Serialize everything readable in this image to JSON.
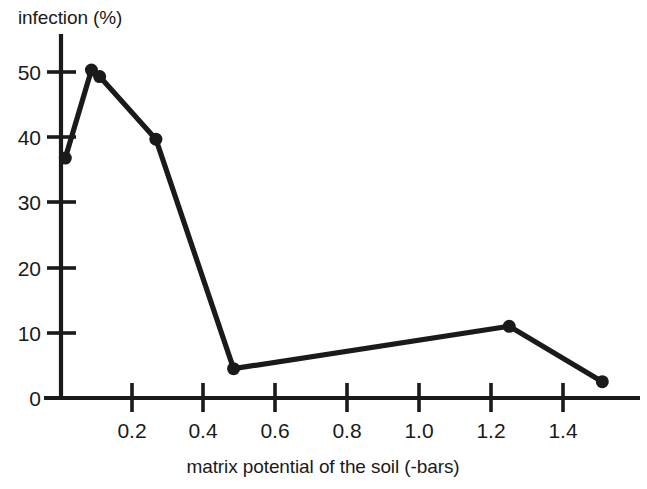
{
  "figure": {
    "background_color": "#ffffff",
    "ink_color": "#1a1a1a",
    "width": 647,
    "height": 489
  },
  "chart_data": {
    "type": "line",
    "title": "",
    "subtitle": "",
    "xlabel": "matrix potential of the soil (-bars)",
    "ylabel": "infection (%)",
    "ylabel_position": "top-left-horizontal",
    "xlim": [
      0.0,
      1.62
    ],
    "ylim": [
      0,
      53
    ],
    "xticks": [
      0.2,
      0.4,
      0.6,
      0.8,
      1.0,
      1.2,
      1.4
    ],
    "xtick_labels": [
      "0.2",
      "0.4",
      "0.6",
      "0.8",
      "1.0",
      "1.2",
      "1.4"
    ],
    "yticks": [
      0,
      10,
      20,
      30,
      40,
      50
    ],
    "ytick_labels": [
      "0",
      "10",
      "20",
      "30",
      "40",
      "50"
    ],
    "grid": false,
    "legend": null,
    "legend_position": "none",
    "marker": "filled-circle",
    "marker_size_px": 13,
    "line_style": "solid",
    "annotations": [],
    "series": [
      {
        "name": "infection",
        "x": [
          0.012,
          0.085,
          0.108,
          0.265,
          0.482,
          1.252,
          1.512
        ],
        "values": [
          36.8,
          50.3,
          49.3,
          39.7,
          4.5,
          11.0,
          2.5
        ],
        "points": [
          {
            "x": 0.012,
            "y": 36.8
          },
          {
            "x": 0.085,
            "y": 50.3
          },
          {
            "x": 0.108,
            "y": 49.3
          },
          {
            "x": 0.265,
            "y": 39.7
          },
          {
            "x": 0.482,
            "y": 4.5
          },
          {
            "x": 1.252,
            "y": 11.0
          },
          {
            "x": 1.512,
            "y": 2.5
          }
        ]
      }
    ]
  }
}
